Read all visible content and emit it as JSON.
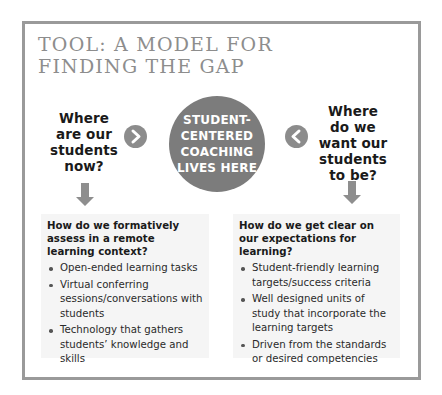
{
  "title": {
    "lines": [
      "TOOL: A MODEL FOR",
      "FINDING THE GAP"
    ]
  },
  "left_question": {
    "lines": [
      "Where",
      "are our",
      "students",
      "now?"
    ]
  },
  "right_question": {
    "lines": [
      "Where",
      "do we",
      "want our",
      "students",
      "to be?"
    ]
  },
  "center_hub": {
    "lines": [
      "STUDENT-",
      "CENTERED",
      "COACHING",
      "LIVES HERE"
    ]
  },
  "icons": {
    "left_chevron": "chevron-right-icon",
    "right_chevron": "chevron-left-icon",
    "left_arrow": "arrow-down-icon",
    "right_arrow": "arrow-down-icon"
  },
  "left_box": {
    "heading": "How do we formatively assess in a remote learning context?",
    "items": [
      "Open-ended learning tasks",
      "Virtual conferring sessions/conversations with students",
      "Technology that gathers students’ knowledge and skills"
    ]
  },
  "right_box": {
    "heading": "How do we get clear on our expectations for learning?",
    "items": [
      "Student-friendly learning targets/success criteria",
      "Well designed units of study that incorporate the learning targets",
      "Driven from the standards or desired competencies"
    ]
  },
  "colors": {
    "frame_border": "#9a9a9a",
    "title_text": "#8d8d8d",
    "hub_fill": "#7c7c7c",
    "chevron_fill": "#8c8c8c",
    "arrow_fill": "#8e8e8e",
    "box_bg": "#f5f5f5"
  }
}
